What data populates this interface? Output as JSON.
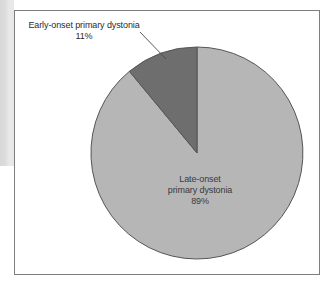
{
  "figure": {
    "frame": {
      "border_color": "#7d7d7d"
    },
    "background": "#ffffff"
  },
  "chart_data": {
    "type": "pie",
    "title": "",
    "subtitle": "",
    "xlabel": "",
    "ylabel": "",
    "legend_position": "none",
    "grid": false,
    "start_angle_deg": 0,
    "direction": "counterclockwise",
    "categories": [
      "Early-onset primary dystonia",
      "Late-onset primary dystonia"
    ],
    "values": [
      11,
      89
    ],
    "value_unit": "%",
    "slices": [
      {
        "label": "Early-onset primary dystonia",
        "value": 11,
        "value_text": "11%",
        "color": "#6e6e6e",
        "label_placement": "outside",
        "leader_line": true
      },
      {
        "label": "Late-onset primary dystonia",
        "value": 89,
        "value_text": "89%",
        "color": "#b6b6b6",
        "label_placement": "inside",
        "leader_line": false
      }
    ]
  },
  "labels": {
    "outside": {
      "name": "Early-onset primary dystonia",
      "percent": "11%"
    },
    "inside": {
      "line1": "Late-onset",
      "line2": "primary dystonia",
      "percent": "89%"
    }
  }
}
